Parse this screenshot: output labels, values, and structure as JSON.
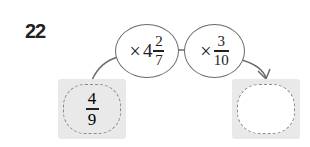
{
  "problem": {
    "number": "22",
    "start_value": {
      "numerator": "4",
      "denominator": "9"
    },
    "operations": [
      {
        "symbol": "×",
        "whole": "4",
        "numerator": "2",
        "denominator": "7"
      },
      {
        "symbol": "×",
        "whole": "",
        "numerator": "3",
        "denominator": "10"
      }
    ],
    "answer_box": {
      "value": ""
    }
  },
  "colors": {
    "box_fill": "#e9e9e9",
    "dash_border": "#8a8a8a",
    "ellipse_border": "#6a6a6a",
    "arrow": "#6a6a6a"
  }
}
